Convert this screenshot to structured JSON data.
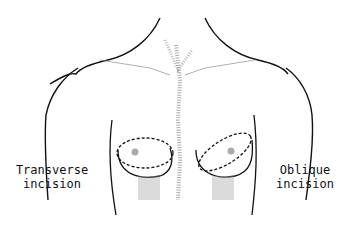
{
  "figure": {
    "labels": {
      "left": {
        "line1": "Transverse",
        "line2": "incision"
      },
      "right": {
        "line1": "Oblique",
        "line2": "incision"
      }
    },
    "colors": {
      "ink": "#111111",
      "shading": "#888888",
      "background": "#ffffff"
    }
  }
}
